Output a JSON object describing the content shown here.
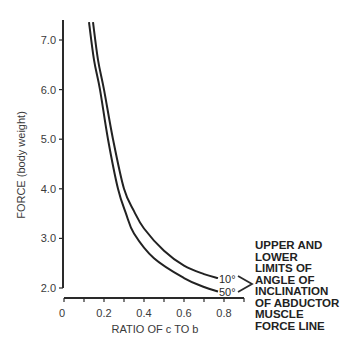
{
  "chart_data": {
    "type": "line",
    "title": "",
    "xlabel": "RATIO OF c TO b",
    "ylabel": "FORCE (body weight)",
    "xlim": [
      0,
      0.9
    ],
    "ylim": [
      2.0,
      7.4
    ],
    "x_ticks": [
      "0",
      "0.2",
      "0.4",
      "0.6",
      "0.8"
    ],
    "x_tick_values": [
      0,
      0.2,
      0.4,
      0.6,
      0.8
    ],
    "y_ticks": [
      "2.0",
      "3.0",
      "4.0",
      "5.0",
      "6.0",
      "7.0"
    ],
    "y_tick_values": [
      2.0,
      3.0,
      4.0,
      5.0,
      6.0,
      7.0
    ],
    "grid": false,
    "series": [
      {
        "name": "10°",
        "x": [
          0.145,
          0.17,
          0.2,
          0.245,
          0.3,
          0.35,
          0.4,
          0.5,
          0.6,
          0.7,
          0.77
        ],
        "values": [
          7.36,
          6.6,
          6.0,
          5.0,
          4.0,
          3.55,
          3.2,
          2.75,
          2.45,
          2.28,
          2.2
        ]
      },
      {
        "name": "50°",
        "x": [
          0.125,
          0.15,
          0.18,
          0.22,
          0.27,
          0.31,
          0.35,
          0.45,
          0.6,
          0.7,
          0.77
        ],
        "values": [
          7.36,
          6.6,
          6.0,
          5.0,
          4.0,
          3.5,
          3.1,
          2.6,
          2.2,
          2.02,
          1.93
        ]
      }
    ],
    "annotations": [
      {
        "text": "UPPER AND LOWER LIMITS OF ANGLE OF INCLINATION OF ABDUCTOR MUSCLE FORCE LINE",
        "position": "right"
      }
    ]
  },
  "labels": {
    "curve_upper": "10°",
    "curve_lower": "50°",
    "xlabel": "RATIO OF c TO b",
    "ylabel": "FORCE (body weight)",
    "legend_lines": [
      "UPPER AND",
      "LOWER",
      "LIMITS OF",
      "ANGLE OF",
      "INCLINATION",
      "OF ABDUCTOR",
      "MUSCLE",
      "FORCE LINE"
    ]
  }
}
